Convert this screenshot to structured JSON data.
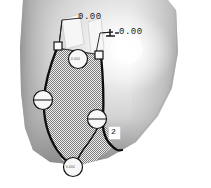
{
  "view": {
    "title": "3D shaded part with GD&T annotations",
    "background_color": "#ffffff",
    "surface_light_color": "#f2f2f2",
    "surface_mid_color": "#b9b9b9",
    "surface_dark_color": "#8a8a8a",
    "outline_color": "#101010",
    "callout_fill": "#f4f4f4",
    "hatch_color": "#808080"
  },
  "annotations": {
    "dimension_1": {
      "value": "0.00",
      "symbol": ""
    },
    "dimension_2": {
      "value": "0.00",
      "symbol": "perpendicularity"
    },
    "face_label": {
      "value": "2"
    }
  },
  "balloons": [
    {
      "id": "balloon-top",
      "text": "0.000"
    },
    {
      "id": "balloon-left",
      "text": ""
    },
    {
      "id": "balloon-right",
      "text": ""
    },
    {
      "id": "balloon-bottom",
      "text": "0.000"
    }
  ],
  "datum_squares": [
    {
      "id": "datum-left"
    },
    {
      "id": "datum-right"
    }
  ]
}
